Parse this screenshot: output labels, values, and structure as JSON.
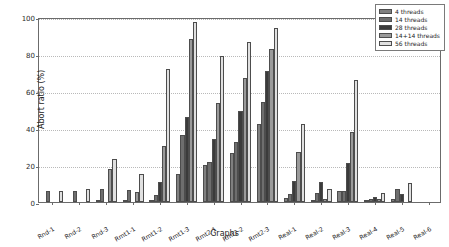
{
  "chart_data": {
    "type": "bar",
    "title": "",
    "xlabel": "Graphs",
    "ylabel": "Abort ratio (%)",
    "ylim": [
      0,
      100
    ],
    "yticks": [
      0,
      20,
      40,
      60,
      80,
      100
    ],
    "grid": true,
    "legend_position": "upper right",
    "categories": [
      "Rnd-1",
      "Rnd-2",
      "Rnd-3",
      "Rmt1-1",
      "Rmt1-2",
      "Rmt1-3",
      "Rmt2-1",
      "Rmt2-2",
      "Rmt2-3",
      "Real-1",
      "Real-2",
      "Real-3",
      "Real-4",
      "Real-5",
      "Real-6"
    ],
    "series": [
      {
        "name": "4 threads",
        "color": "#808080",
        "values": [
          0.0,
          0.0,
          1.2,
          0.4,
          0.8,
          15.0,
          20.0,
          26.5,
          42.3,
          2.2,
          1.1,
          5.7,
          1.3,
          1.5,
          0.0
        ]
      },
      {
        "name": "14 threads",
        "color": "#6e6e6e",
        "values": [
          5.8,
          6.0,
          7.0,
          6.4,
          3.8,
          36.0,
          21.5,
          32.3,
          54.3,
          4.6,
          4.7,
          6.2,
          1.6,
          6.8,
          0.0
        ]
      },
      {
        "name": "28 threads",
        "color": "#3b3b3b",
        "values": [
          0.0,
          0.0,
          0.0,
          0.0,
          11.0,
          45.8,
          34.3,
          49.0,
          70.6,
          11.2,
          10.7,
          21.2,
          2.9,
          4.2,
          0.0
        ]
      },
      {
        "name": "14+14 threads",
        "color": "#9a9a9a",
        "values": [
          0.0,
          0.0,
          17.6,
          5.2,
          30.3,
          88.2,
          53.7,
          66.8,
          82.8,
          26.8,
          1.9,
          38.1,
          1.4,
          0.0,
          0.0
        ]
      },
      {
        "name": "56 threads",
        "color": "#e0e0e0",
        "values": [
          5.9,
          6.8,
          23.4,
          14.9,
          71.8,
          97.4,
          78.8,
          86.7,
          94.3,
          42.0,
          7.2,
          66.0,
          4.9,
          10.4,
          0.0
        ]
      }
    ]
  }
}
